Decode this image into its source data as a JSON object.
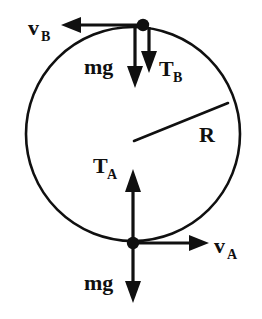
{
  "diagram": {
    "type": "free-body-diagram",
    "colors": {
      "ink": "#101010",
      "background": "#ffffff"
    },
    "circle": {
      "center_x": 133,
      "center_y": 134,
      "radius": 108,
      "radius_label": "R"
    },
    "points": {
      "top": {
        "name": "B",
        "x": 143,
        "y": 26
      },
      "bottom": {
        "name": "A",
        "x": 133,
        "y": 243
      }
    },
    "labels": {
      "velocity_top": {
        "base": "v",
        "sub": "B"
      },
      "velocity_bottom": {
        "base": "v",
        "sub": "A"
      },
      "tension_top": {
        "base": "T",
        "sub": "B"
      },
      "tension_bottom": {
        "base": "T",
        "sub": "A"
      },
      "weight_top": "mg",
      "weight_bottom": "mg",
      "radius": "R"
    },
    "vectors": [
      {
        "id": "v-top",
        "label": "v_B",
        "direction": "left",
        "origin": "top-point"
      },
      {
        "id": "mg-top",
        "label": "mg",
        "direction": "down",
        "origin": "top-point"
      },
      {
        "id": "T-top",
        "label": "T_B",
        "direction": "down",
        "origin": "top-point"
      },
      {
        "id": "T-bottom",
        "label": "T_A",
        "direction": "up",
        "origin": "bottom-point"
      },
      {
        "id": "v-bottom",
        "label": "v_A",
        "direction": "right",
        "origin": "bottom-point"
      },
      {
        "id": "mg-bottom",
        "label": "mg",
        "direction": "down",
        "origin": "bottom-point"
      }
    ]
  }
}
